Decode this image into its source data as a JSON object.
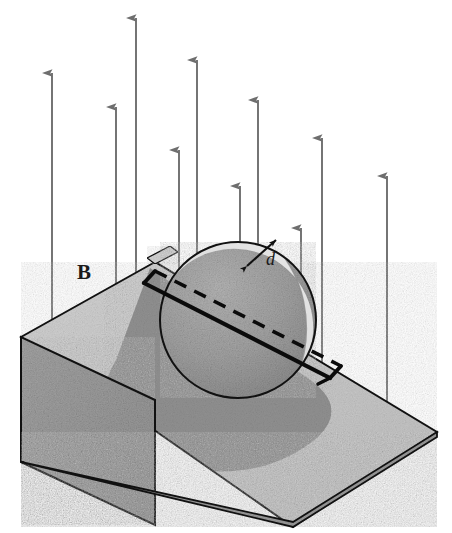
{
  "figure": {
    "width": 452,
    "height": 533,
    "background_color": "#ffffff"
  },
  "labels": {
    "field_label": "B",
    "field_label_style": "bold-serif",
    "field_label_position": {
      "x": 77,
      "y": 262
    },
    "thickness_label": "d",
    "thickness_label_style": "italic-serif",
    "thickness_label_position": {
      "x": 266,
      "y": 250
    }
  },
  "colors": {
    "outline": "#111111",
    "arrow_gray": "#6e6e6e",
    "incline_top_face": "#c9c9c9",
    "incline_left_face": "#9a9a9a",
    "incline_front_face": "#8f8f8f",
    "incline_shadow": "#8a8a8a",
    "disc_body": "#a0a0a0",
    "disc_rim": "#d8d8d8",
    "disc_dark_edge": "#8d8d8d",
    "loop_line": "#0b0b0b"
  },
  "magnetic_field": {
    "direction": "up",
    "symbol": "B",
    "arrow_count": 10,
    "arrow_color": "#6e6e6e",
    "arrows": [
      {
        "name": "arrow-1",
        "x": 52,
        "tip_y": 73,
        "tail_y": 352
      },
      {
        "name": "arrow-2",
        "x": 116,
        "tip_y": 107,
        "tail_y": 393
      },
      {
        "name": "arrow-3",
        "x": 136,
        "tip_y": 18,
        "tail_y": 335
      },
      {
        "name": "arrow-4",
        "x": 179,
        "tip_y": 150,
        "tail_y": 425
      },
      {
        "name": "arrow-5",
        "x": 197,
        "tip_y": 60,
        "tail_y": 300
      },
      {
        "name": "arrow-6",
        "x": 240,
        "tip_y": 186,
        "tail_y": 470
      },
      {
        "name": "arrow-7",
        "x": 258,
        "tip_y": 100,
        "tail_y": 306
      },
      {
        "name": "arrow-8",
        "x": 301,
        "tip_y": 228,
        "tail_y": 500
      },
      {
        "name": "arrow-9",
        "x": 322,
        "tip_y": 138,
        "tail_y": 450
      },
      {
        "name": "arrow-10",
        "x": 387,
        "tip_y": 176,
        "tail_y": 455
      }
    ]
  },
  "incline": {
    "name": "inclined-plane-wedge",
    "apex": {
      "x": 155,
      "y": 262
    },
    "left_top_corner": {
      "x": 21,
      "y": 337
    },
    "left_bottom_corner": {
      "x": 21,
      "y": 462
    },
    "front_bottom_corner": {
      "x": 293,
      "y": 527
    },
    "right_corner": {
      "x": 437,
      "y": 437
    },
    "ramp_right_corner": {
      "x": 437,
      "y": 432
    },
    "top_face_polygon": "155,262 21,337 293,527 437,432",
    "left_face_polygon": "21,337 21,462 155,525 155,400",
    "front_face_polygon": "21,462 293,527 437,437 437,432 293,522",
    "shadow_description": "elliptical shadow of disc cast on ramp surface"
  },
  "disc": {
    "name": "conducting-disc",
    "center": {
      "x": 238,
      "y": 320
    },
    "radius_x": 78,
    "radius_y": 78,
    "rim_thickness_label": "d",
    "body_color": "#a0a0a0",
    "rim_color": "#d8d8d8",
    "description": "circular disc (cylinder seen nearly face-on) resting on the incline"
  },
  "current_loop": {
    "name": "current-loop-rectangle",
    "description": "rectangular loop inside the disc; near edges solid, far edge dashed",
    "corner_near_left": {
      "x": 144,
      "y": 283
    },
    "corner_near_right": {
      "x": 330,
      "y": 378
    },
    "corner_far_left": {
      "x": 155,
      "y": 272
    },
    "corner_far_right": {
      "x": 341,
      "y": 367
    },
    "solid_segments": 2,
    "dashed_segments": 1,
    "line_color": "#0b0b0b"
  },
  "thickness_indicator": {
    "name": "thickness-arrow",
    "label": "d",
    "start": {
      "x": 247,
      "y": 265
    },
    "end": {
      "x": 274,
      "y": 240
    },
    "double_headed": true
  }
}
